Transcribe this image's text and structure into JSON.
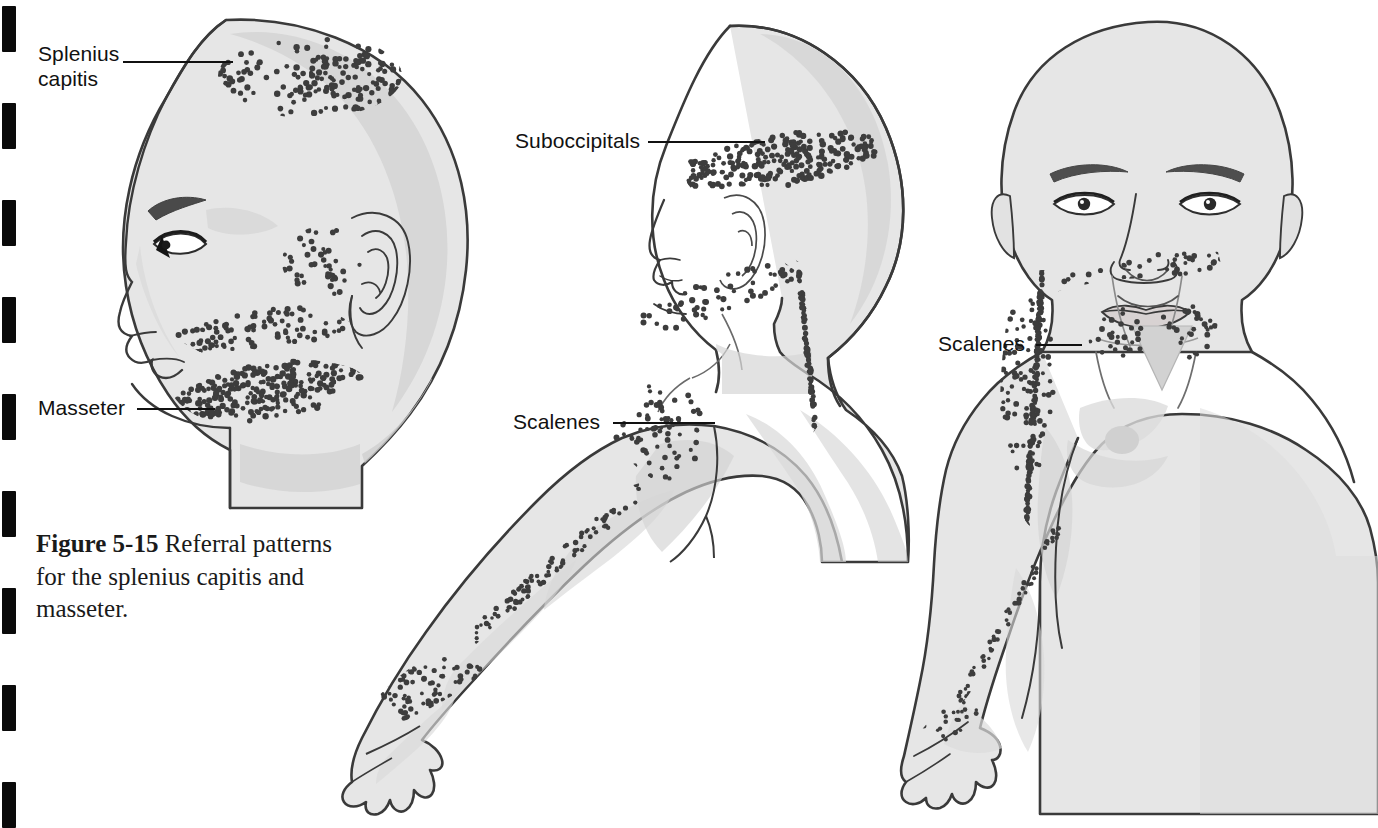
{
  "page": {
    "background_color": "#ffffff",
    "width": 1378,
    "height": 817
  },
  "colors": {
    "outline": "#3a3a3a",
    "body_fill": "#e6e6e6",
    "shadow_fill": "#d0d0d0",
    "deep_shadow_fill": "#c2c2c2",
    "dot_color": "#3d3d3d",
    "label_text": "#111111",
    "leader_line": "#111111",
    "binding_mark": "#0a0a0a"
  },
  "caption": {
    "number": "Figure 5-15",
    "text": "Referral patterns for the splenius capitis and masseter."
  },
  "binding_marks": {
    "count": 9,
    "positions_y": [
      6,
      103,
      200,
      297,
      394,
      491,
      588,
      685,
      782
    ],
    "width": 14,
    "height": 46
  },
  "figures": [
    {
      "id": "figure-left-head",
      "name": "lateral-head-splenius-masseter",
      "view": "left lateral head and neck profile",
      "labels": [
        {
          "id": "label-splenius-capitis",
          "text": "Splenius\ncapitis",
          "lines": [
            "Splenius",
            "capitis"
          ],
          "x": 38,
          "y": 42,
          "leader": {
            "x": 123,
            "y": 61,
            "length": 110
          }
        },
        {
          "id": "label-masseter",
          "text": "Masseter",
          "lines": [
            "Masseter"
          ],
          "x": 38,
          "y": 396,
          "leader": {
            "x": 137,
            "y": 408,
            "length": 78
          }
        }
      ],
      "dot_regions": [
        {
          "name": "splenius-capitis-vertex",
          "density": "dense",
          "count": 120
        },
        {
          "name": "masseter-preauricular",
          "density": "medium",
          "count": 46
        },
        {
          "name": "masseter-cheek-band",
          "density": "dense",
          "count": 110
        },
        {
          "name": "masseter-mandible-band",
          "density": "very-dense",
          "count": 210
        }
      ]
    },
    {
      "id": "figure-middle-body",
      "name": "posterior-lateral-body-suboccipitals-scalenes",
      "view": "posterolateral head, neck, shoulder and arm",
      "labels": [
        {
          "id": "label-suboccipitals",
          "text": "Suboccipitals",
          "lines": [
            "Suboccipitals"
          ],
          "x": 515,
          "y": 129,
          "leader": {
            "x": 648,
            "y": 141,
            "length": 117
          }
        },
        {
          "id": "label-scalenes-middle",
          "text": "Scalenes",
          "lines": [
            "Scalenes"
          ],
          "x": 513,
          "y": 410,
          "leader": {
            "x": 613,
            "y": 422,
            "length": 102
          }
        }
      ],
      "dot_regions": [
        {
          "name": "suboccipital-head-band",
          "density": "very-dense",
          "count": 175
        },
        {
          "name": "upper-trapezius-shoulder",
          "density": "medium",
          "count": 60
        },
        {
          "name": "medial-scapula-band",
          "density": "dense",
          "count": 95
        },
        {
          "name": "lateral-upper-arm",
          "density": "medium",
          "count": 70
        },
        {
          "name": "radial-forearm-trail",
          "density": "sparse",
          "count": 95
        },
        {
          "name": "thumb-index-hand",
          "density": "dense",
          "count": 120
        }
      ]
    },
    {
      "id": "figure-right-body",
      "name": "anterior-body-scalenes",
      "view": "anterior head, chest, shoulder and arm",
      "labels": [
        {
          "id": "label-scalenes-right",
          "text": "Scalenes",
          "lines": [
            "Scalenes"
          ],
          "x": 938,
          "y": 332,
          "leader": {
            "x": 1036,
            "y": 344,
            "length": 46
          }
        }
      ],
      "dot_regions": [
        {
          "name": "lateral-deltoid-dense",
          "density": "very-dense",
          "count": 190
        },
        {
          "name": "clavicle-scatter",
          "density": "sparse",
          "count": 42
        },
        {
          "name": "pectoral-cluster",
          "density": "medium",
          "count": 55
        },
        {
          "name": "radial-forearm-trail",
          "density": "sparse",
          "count": 60
        },
        {
          "name": "thumb-hand",
          "density": "sparse",
          "count": 28
        }
      ]
    }
  ]
}
